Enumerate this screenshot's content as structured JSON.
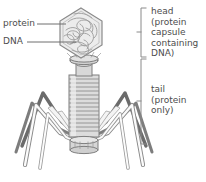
{
  "diagram": {
    "background_color": "#ffffff",
    "labels": {
      "protein": "protein",
      "dna": "DNA",
      "head": "head\n(protein\ncapsule\ncontaining\nDNA)",
      "tail": "tail\n(protein\nonly)"
    },
    "colors": {
      "text": "#4d4d4d",
      "outline": "#8a8a8a",
      "outline_dark": "#6e6e6e",
      "leg_dark": "#6b6b6b",
      "leg_light": "#f2f2f2",
      "capsid_fill": "#ececec",
      "sheath_fill": "#dcdcdc",
      "collar_fill": "#d2d2d2",
      "leader_line": "#7a7a7a",
      "bracket": "#8a8a8a"
    },
    "parts": [
      {
        "name": "head-capsid",
        "shape": "hexagon",
        "contents": "tangled DNA strands"
      },
      {
        "name": "dna-strands",
        "shape": "tangled curves"
      },
      {
        "name": "collar",
        "shape": "disc"
      },
      {
        "name": "neck",
        "shape": "narrow cylinder"
      },
      {
        "name": "tail-sheath",
        "shape": "striped cylinder",
        "rings": 14
      },
      {
        "name": "base-plate",
        "shape": "oval disc"
      },
      {
        "name": "legs",
        "count": 6,
        "shape": "bent fibers"
      }
    ],
    "brackets": [
      {
        "name": "head-bracket",
        "x": 141,
        "top": 8,
        "bottom": 57,
        "tick_y": 32
      },
      {
        "name": "tail-bracket",
        "x": 141,
        "top": 59,
        "bottom": 144,
        "tick_y": 101
      }
    ]
  }
}
